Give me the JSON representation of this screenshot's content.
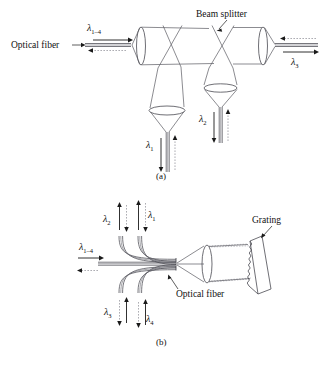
{
  "figure": {
    "panels": [
      {
        "id": "a",
        "caption": "(a)",
        "labels": {
          "optical_fiber": "Optical fiber",
          "beam_splitter": "Beam splitter"
        },
        "wavelengths": [
          {
            "name": "lambda-1-4",
            "symbol": "λ",
            "sub": "1–4",
            "position": "left-input"
          },
          {
            "name": "lambda-3",
            "symbol": "λ",
            "sub": "3",
            "position": "right-output"
          },
          {
            "name": "lambda-1",
            "symbol": "λ",
            "sub": "1",
            "position": "bottom-left-output"
          },
          {
            "name": "lambda-2",
            "symbol": "λ",
            "sub": "2",
            "position": "bottom-right-output"
          }
        ],
        "components": [
          "lens",
          "lens",
          "lens",
          "lens",
          "beam-splitter",
          "beam-splitter"
        ]
      },
      {
        "id": "b",
        "caption": "(b)",
        "labels": {
          "optical_fiber": "Optical fiber",
          "grating": "Grating"
        },
        "wavelengths": [
          {
            "name": "lambda-1-4",
            "symbol": "λ",
            "sub": "1–4",
            "position": "left-input"
          },
          {
            "name": "lambda-2",
            "symbol": "λ",
            "sub": "2",
            "position": "top-outer"
          },
          {
            "name": "lambda-1",
            "symbol": "λ",
            "sub": "1",
            "position": "top-inner"
          },
          {
            "name": "lambda-3",
            "symbol": "λ",
            "sub": "3",
            "position": "bottom-outer"
          },
          {
            "name": "lambda-4",
            "symbol": "λ",
            "sub": "4",
            "position": "bottom-inner"
          }
        ],
        "components": [
          "fiber-bundle",
          "lens",
          "grating"
        ]
      }
    ],
    "colors": {
      "line": "#5a5a62",
      "line_dark": "#1a1a1a",
      "dashed": "#8a8a92",
      "background": "#ffffff"
    }
  }
}
